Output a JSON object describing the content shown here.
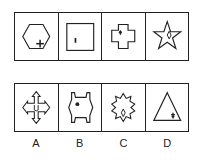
{
  "puzzle": {
    "question_row": [
      {
        "shape": "hexagon",
        "inner": "plus-sign"
      },
      {
        "shape": "square",
        "inner": "vertical-dash"
      },
      {
        "shape": "cross",
        "inner": "small-blob"
      },
      {
        "shape": "five-point-star",
        "inner": "small-diamond"
      }
    ],
    "options": [
      {
        "label": "A",
        "shape": "four-arrow-cross",
        "inner": "small-u"
      },
      {
        "label": "B",
        "shape": "notched-hexagon",
        "inner": "small-blob"
      },
      {
        "label": "C",
        "shape": "eight-point-star",
        "inner": "small-diamond"
      },
      {
        "label": "D",
        "shape": "triangle",
        "inner": "small-tree"
      }
    ]
  }
}
